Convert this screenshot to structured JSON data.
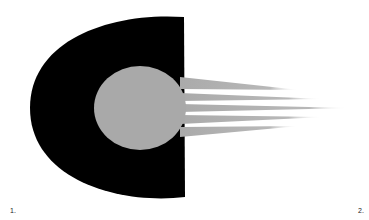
{
  "figure": {
    "labels": [
      "1.",
      "2."
    ],
    "colors": {
      "dark_shape": "#000000",
      "disc": "#a9a9a9",
      "rays": "#b0b0b0",
      "background": "#ffffff"
    }
  }
}
